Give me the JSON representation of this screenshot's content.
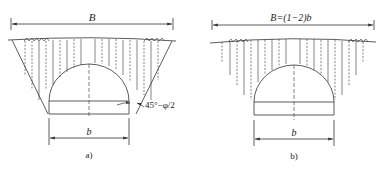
{
  "diagram": {
    "type": "tunnel-cross-section-comparison",
    "line_color": "#333333",
    "background": "#ffffff",
    "panels": [
      {
        "id": "a",
        "caption": "a)",
        "top_dimension_label": "B",
        "bottom_dimension_label": "b",
        "angle_annotation": "45°−φ/2"
      },
      {
        "id": "b",
        "caption": "b)",
        "top_dimension_label": "B=(1−2)b",
        "bottom_dimension_label": "b"
      }
    ]
  }
}
